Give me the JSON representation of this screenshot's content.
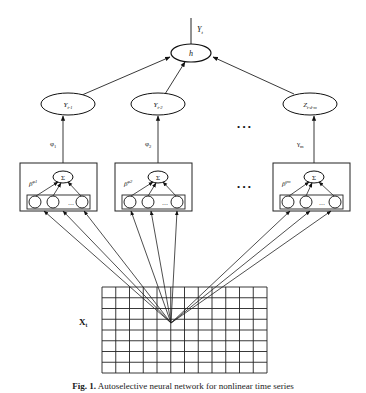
{
  "figure": {
    "output": {
      "label": "Y",
      "subscript": "t"
    },
    "combiner": {
      "label": "h"
    },
    "nodes": [
      {
        "id": "y1",
        "label": "Y",
        "subscript": "t-1",
        "weight": "φ",
        "weight_sub": "1",
        "beta": "β",
        "beta_sup": "φ1"
      },
      {
        "id": "y2",
        "label": "Y",
        "subscript": "t-2",
        "weight": "φ",
        "weight_sub": "2",
        "beta": "β",
        "beta_sup": "φ2"
      },
      {
        "id": "zm",
        "label": "Z",
        "subscript": "t-d-m",
        "weight": "γ",
        "weight_sub": "m",
        "beta": "β",
        "beta_sup": "γm"
      }
    ],
    "sum_symbol": "Σ",
    "ellipsis_inner": "…",
    "ellipsis_dots": "•  •  •",
    "input": {
      "label": "X",
      "subscript": "t"
    },
    "grid": {
      "columns": 12,
      "rows": 8
    }
  },
  "caption": {
    "prefix": "Fig. 1.",
    "text": "Autoselective neural network for nonlinear time series"
  }
}
